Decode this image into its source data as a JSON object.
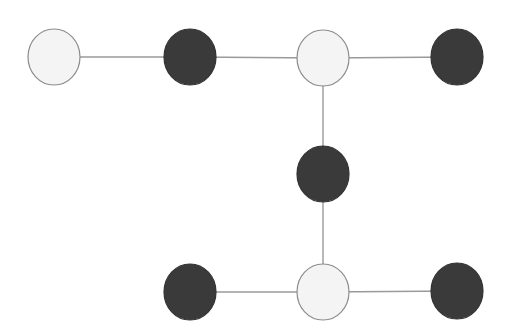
{
  "diagram": {
    "width": 513,
    "height": 328,
    "colors": {
      "background": "#ffffff",
      "edge": "#9a9a9a",
      "light_fill": "#f4f4f4",
      "light_stroke": "#8c8c8c",
      "dark_fill": "#3a3a3a",
      "dark_stroke": "#333333"
    },
    "node_rx": 26,
    "node_ry": 28,
    "nodes": [
      {
        "id": "n1",
        "x": 54,
        "y": 57,
        "type": "light"
      },
      {
        "id": "n2",
        "x": 190,
        "y": 57,
        "type": "dark"
      },
      {
        "id": "n3",
        "x": 323,
        "y": 58,
        "type": "light"
      },
      {
        "id": "n4",
        "x": 457,
        "y": 57,
        "type": "dark"
      },
      {
        "id": "n5",
        "x": 323,
        "y": 174,
        "type": "dark"
      },
      {
        "id": "n6",
        "x": 190,
        "y": 292,
        "type": "dark"
      },
      {
        "id": "n7",
        "x": 323,
        "y": 292,
        "type": "light"
      },
      {
        "id": "n8",
        "x": 457,
        "y": 291,
        "type": "dark"
      }
    ],
    "edges": [
      [
        "n1",
        "n2"
      ],
      [
        "n2",
        "n3"
      ],
      [
        "n3",
        "n4"
      ],
      [
        "n3",
        "n5"
      ],
      [
        "n5",
        "n7"
      ],
      [
        "n6",
        "n7"
      ],
      [
        "n7",
        "n8"
      ]
    ]
  }
}
